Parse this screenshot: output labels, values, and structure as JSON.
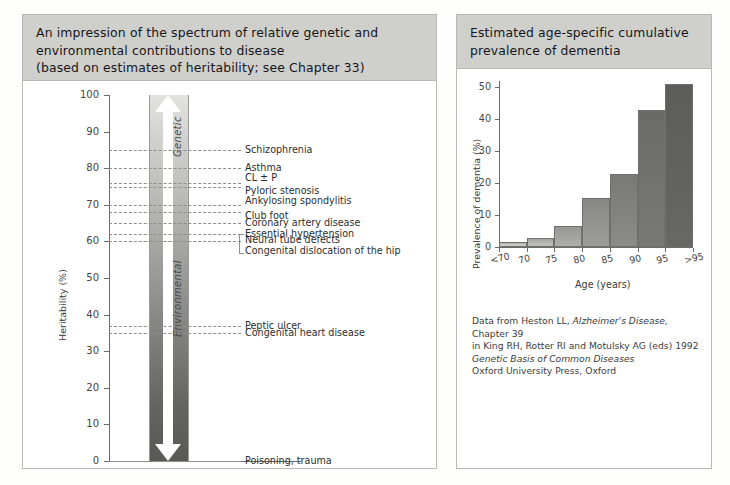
{
  "panels": {
    "left": {
      "title_lines": [
        "An impression of the spectrum of relative genetic and",
        "environmental contributions to disease",
        "(based on estimates of heritability; see Chapter 33)"
      ],
      "arrow_top_label": "Genetic",
      "arrow_bottom_label": "Environmental"
    },
    "right": {
      "title_lines": [
        "Estimated age-specific cumulative",
        "prevalence of dementia"
      ],
      "source_lines": [
        "Data from Heston LL, Alzheimer's Disease, Chapter 39",
        "in King RH, Rotter RI and Motulsky AG (eds) 1992",
        "Genetic Basis of Common Diseases",
        "Oxford University Press, Oxford"
      ],
      "source_italic_segment": "Alzheimer's Disease,"
    }
  },
  "chart_data": [
    {
      "type": "scatter",
      "id": "heritability-spectrum",
      "title": "An impression of the spectrum of relative genetic and environmental contributions to disease",
      "xlabel": "",
      "ylabel": "Heritability (%)",
      "ylim": [
        0,
        100
      ],
      "yticks": [
        0,
        10,
        20,
        30,
        40,
        50,
        60,
        70,
        80,
        90,
        100
      ],
      "grid": false,
      "annotations": [
        "Genetic",
        "Environmental"
      ],
      "points": [
        {
          "label": "Schizophrenia",
          "value": 85
        },
        {
          "label": "Asthma",
          "value": 80
        },
        {
          "label": "CL ± P",
          "value": 76
        },
        {
          "label": "Pyloric stenosis",
          "value": 75
        },
        {
          "label": "Ankylosing spondylitis",
          "value": 70
        },
        {
          "label": "Club foot",
          "value": 68
        },
        {
          "label": "Coronary artery disease",
          "value": 65
        },
        {
          "label": "Essential hypertension",
          "value": 62
        },
        {
          "label": "Neural tube defects",
          "value": 60
        },
        {
          "label": "Congenital dislocation of the hip",
          "value": 60
        },
        {
          "label": "Peptic ulcer",
          "value": 37
        },
        {
          "label": "Congenital heart disease",
          "value": 35
        },
        {
          "label": "Poisoning, trauma",
          "value": 0
        }
      ]
    },
    {
      "type": "bar",
      "id": "dementia-prevalence",
      "title": "Estimated age-specific cumulative prevalence of dementia",
      "xlabel": "Age (years)",
      "ylabel": "Prevalence of dementia (%)",
      "ylim": [
        0,
        52
      ],
      "yticks": [
        0,
        10,
        20,
        30,
        40,
        50
      ],
      "categories": [
        "<70",
        "70",
        "75",
        "80",
        "85",
        "90",
        "95",
        ">95"
      ],
      "bar_edges": [
        "<70",
        "70",
        "75",
        "80",
        "85",
        "90",
        "95",
        ">95"
      ],
      "values": [
        1.5,
        2.8,
        6.5,
        15.5,
        23,
        43,
        51
      ],
      "grid": false
    }
  ]
}
